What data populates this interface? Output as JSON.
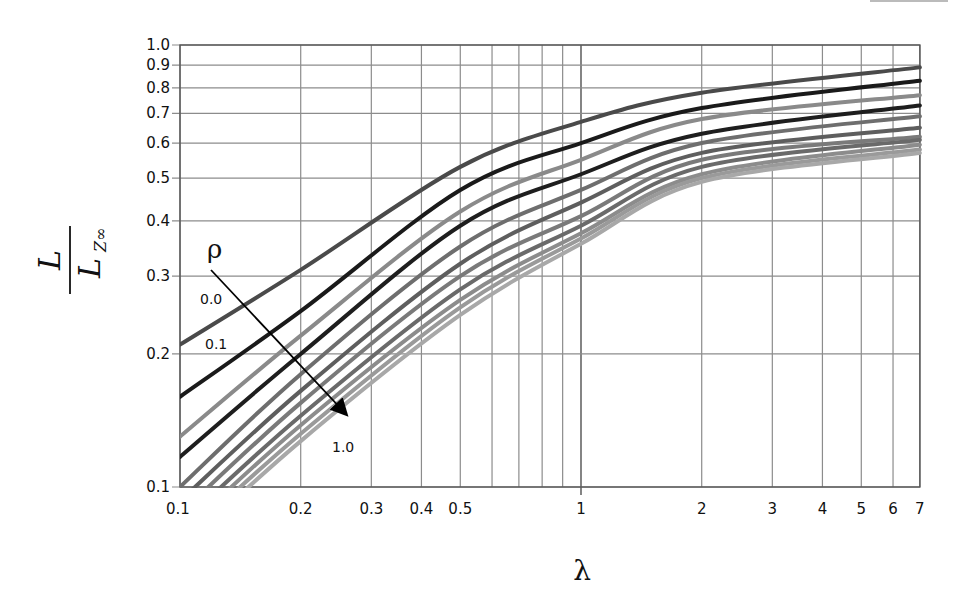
{
  "chart_data": {
    "type": "line",
    "title": "",
    "xlabel": "λ",
    "ylabel": "L / L_Z∞",
    "ylabel_parts": {
      "numerator": "L",
      "denominator": "L",
      "subscript": "Z∞"
    },
    "xscale": "log",
    "yscale": "log",
    "xlim": [
      0.1,
      7
    ],
    "ylim": [
      0.1,
      1.0
    ],
    "grid": true,
    "x_ticks": [
      0.1,
      0.2,
      0.3,
      0.4,
      0.5,
      1,
      2,
      3,
      4,
      5,
      6,
      7
    ],
    "x_tick_labels": [
      "0.1",
      "0.2",
      "0.3",
      "0.4",
      "0.5",
      "1",
      "2",
      "3",
      "4",
      "5",
      "6",
      "7"
    ],
    "x_minor_gridlines": [
      0.6,
      0.7,
      0.8,
      0.9
    ],
    "y_ticks": [
      0.1,
      0.2,
      0.3,
      0.4,
      0.5,
      0.6,
      0.7,
      0.8,
      0.9,
      1.0
    ],
    "y_tick_labels": [
      "0.1",
      "0.2",
      "0.3",
      "0.4",
      "0.5",
      "0.6",
      "0.7",
      "0.8",
      "0.9",
      "1.0"
    ],
    "x": [
      0.1,
      0.2,
      0.5,
      1,
      2,
      7
    ],
    "series": [
      {
        "name": "ρ = 0.0",
        "color": "#4a4a4a",
        "values": [
          0.21,
          0.31,
          0.53,
          0.67,
          0.78,
          0.89
        ]
      },
      {
        "name": "ρ = 0.1",
        "color": "#1a1a1a",
        "values": [
          0.16,
          0.25,
          0.47,
          0.6,
          0.72,
          0.83
        ]
      },
      {
        "name": "ρ = 0.2",
        "color": "#8a8a8a",
        "values": [
          0.13,
          0.22,
          0.42,
          0.55,
          0.68,
          0.77
        ]
      },
      {
        "name": "ρ = 0.3",
        "color": "#1e1e1e",
        "values": [
          0.117,
          0.2,
          0.39,
          0.51,
          0.63,
          0.73
        ]
      },
      {
        "name": "ρ = 0.4",
        "color": "#6e6e6e",
        "values": [
          0.1,
          0.18,
          0.35,
          0.47,
          0.6,
          0.69
        ]
      },
      {
        "name": "ρ = 0.5",
        "color": "#5e5e5e",
        "values": [
          0.093,
          0.165,
          0.32,
          0.44,
          0.57,
          0.65
        ]
      },
      {
        "name": "ρ = 0.6",
        "color": "#7a7a7a",
        "values": [
          0.087,
          0.155,
          0.3,
          0.41,
          0.55,
          0.62
        ]
      },
      {
        "name": "ρ = 0.7",
        "color": "#6a6a6a",
        "values": [
          0.082,
          0.145,
          0.28,
          0.39,
          0.53,
          0.61
        ]
      },
      {
        "name": "ρ = 0.8",
        "color": "#8c8c8c",
        "values": [
          0.078,
          0.138,
          0.265,
          0.375,
          0.51,
          0.595
        ]
      },
      {
        "name": "ρ = 0.9",
        "color": "#9a9a9a",
        "values": [
          0.075,
          0.132,
          0.255,
          0.365,
          0.5,
          0.58
        ]
      },
      {
        "name": "ρ = 1.0",
        "color": "#a8a8a8",
        "values": [
          0.072,
          0.127,
          0.245,
          0.355,
          0.49,
          0.57
        ]
      }
    ],
    "annotations": {
      "parameter_symbol": "ρ",
      "arrow_direction": "increasing ρ",
      "labels": [
        "0.0",
        "0.1",
        "1.0"
      ]
    },
    "legend": "none (inline annotations)"
  },
  "labels": {
    "x_axis": "λ",
    "y_num": "L",
    "y_den": "L",
    "y_sub": "Z∞",
    "rho": "ρ",
    "rho_0": "0.0",
    "rho_01": "0.1",
    "rho_1": "1.0"
  },
  "colors": {
    "grid": "#8c8c8c",
    "axis": "#555555",
    "text": "#111111",
    "arrow": "#000000"
  }
}
